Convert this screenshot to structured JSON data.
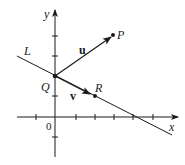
{
  "diagram": {
    "colors": {
      "ink": "#1a1a1a",
      "background": "#ffffff"
    },
    "axes": {
      "x_label": "x",
      "y_label": "y",
      "origin_label": "0"
    },
    "line": {
      "label": "L"
    },
    "points": {
      "P": {
        "label": "P"
      },
      "Q": {
        "label": "Q"
      },
      "R": {
        "label": "R"
      }
    },
    "vectors": {
      "u": {
        "label": "u",
        "from": "Q",
        "to": "P"
      },
      "v": {
        "label": "v",
        "from": "Q",
        "direction": "along L toward R"
      }
    }
  }
}
